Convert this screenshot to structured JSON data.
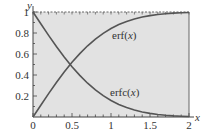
{
  "chart_data": {
    "type": "line",
    "title": "",
    "xlabel": "x",
    "ylabel": "y",
    "xlim": [
      0,
      2
    ],
    "ylim": [
      0,
      1
    ],
    "x_ticks": [
      "0",
      "0.5",
      "1",
      "1.5",
      "2"
    ],
    "y_ticks": [
      "0.2",
      "0.4",
      "0.6",
      "0.8",
      "1"
    ],
    "grid": false,
    "background": "#e2e2e2",
    "series": [
      {
        "name": "erf(x)",
        "label_prefix": "erf(",
        "label_var": "x",
        "label_suffix": ")",
        "color": "#555555",
        "x": [
          0,
          0.1,
          0.2,
          0.3,
          0.4,
          0.5,
          0.6,
          0.7,
          0.8,
          0.9,
          1.0,
          1.1,
          1.2,
          1.3,
          1.4,
          1.5,
          1.6,
          1.7,
          1.8,
          1.9,
          2.0
        ],
        "values": [
          0,
          0.1125,
          0.2227,
          0.3286,
          0.4284,
          0.5205,
          0.6039,
          0.6778,
          0.7421,
          0.7969,
          0.8427,
          0.8802,
          0.9103,
          0.934,
          0.9523,
          0.9661,
          0.9763,
          0.9838,
          0.9891,
          0.9928,
          0.9953
        ]
      },
      {
        "name": "erfc(x)",
        "label_prefix": "erfc(",
        "label_var": "x",
        "label_suffix": ")",
        "color": "#555555",
        "x": [
          0,
          0.1,
          0.2,
          0.3,
          0.4,
          0.5,
          0.6,
          0.7,
          0.8,
          0.9,
          1.0,
          1.1,
          1.2,
          1.3,
          1.4,
          1.5,
          1.6,
          1.7,
          1.8,
          1.9,
          2.0
        ],
        "values": [
          1,
          0.8875,
          0.7773,
          0.6714,
          0.5716,
          0.4795,
          0.3961,
          0.3222,
          0.2579,
          0.2031,
          0.1573,
          0.1198,
          0.0897,
          0.066,
          0.0477,
          0.0339,
          0.0237,
          0.0162,
          0.0109,
          0.0072,
          0.0047
        ]
      }
    ]
  }
}
